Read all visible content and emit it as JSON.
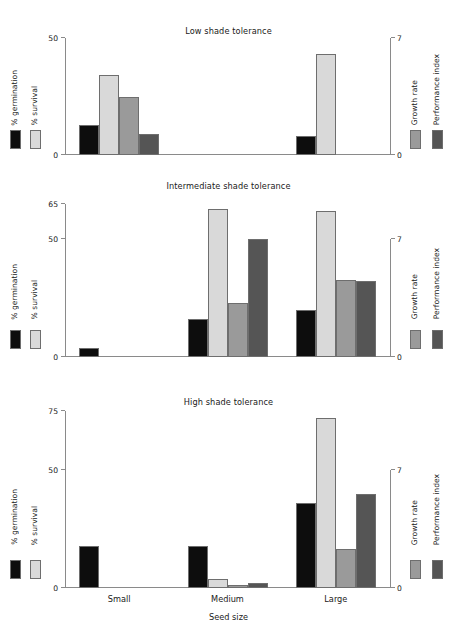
{
  "chart_data": {
    "type": "bar",
    "xlabel": "Seed size",
    "categories": [
      "Small",
      "Medium",
      "Large"
    ],
    "left_axis_label_1": "% germination",
    "left_axis_label_2": "% survival",
    "right_axis_label_1": "Growth rate",
    "right_axis_label_2": "Performance index",
    "grid": false,
    "legend_position": "outside-left-and-right",
    "colors": {
      "germination": "#0d0d0d",
      "survival": "#d9d9d9",
      "growth_rate": "#9a9a9a",
      "performance_index": "#555555",
      "axis": "#8a8a8a",
      "text": "#1a1a1a"
    },
    "panels": [
      {
        "id": "low",
        "title": "Low shade tolerance",
        "left_ticks": [
          0,
          50
        ],
        "left_tick_labels": [
          "0",
          "50"
        ],
        "left_lim": [
          0,
          50
        ],
        "right_ticks": [
          0,
          7
        ],
        "right_tick_labels": [
          "0",
          "7"
        ],
        "right_lim": [
          0,
          7
        ],
        "series": [
          {
            "name": "% germination",
            "axis": "left",
            "values": [
              13,
              0,
              8
            ]
          },
          {
            "name": "% survival",
            "axis": "left",
            "values": [
              34,
              0,
              43
            ]
          },
          {
            "name": "Growth rate",
            "axis": "right",
            "values": [
              3.5,
              0,
              0
            ]
          },
          {
            "name": "Performance index",
            "axis": "right",
            "values": [
              1.25,
              0,
              0
            ]
          }
        ]
      },
      {
        "id": "intermediate",
        "title": "Intermediate shade tolerance",
        "left_ticks": [
          0,
          50,
          65
        ],
        "left_tick_labels": [
          "0",
          "50",
          "65"
        ],
        "left_lim": [
          0,
          65
        ],
        "right_ticks": [
          0,
          7
        ],
        "right_tick_labels": [
          "0",
          "7"
        ],
        "right_lim": [
          0,
          7
        ],
        "series": [
          {
            "name": "% germination",
            "axis": "left",
            "values": [
              4,
              16,
              20
            ]
          },
          {
            "name": "% survival",
            "axis": "left",
            "values": [
              0,
              63,
              62
            ]
          },
          {
            "name": "Growth rate",
            "axis": "right",
            "values": [
              0,
              3.2,
              4.6
            ]
          },
          {
            "name": "Performance index",
            "axis": "right",
            "values": [
              0,
              7.0,
              4.5
            ]
          }
        ]
      },
      {
        "id": "high",
        "title": "High shade tolerance",
        "left_ticks": [
          0,
          50,
          75
        ],
        "left_tick_labels": [
          "0",
          "50",
          "75"
        ],
        "left_lim": [
          0,
          75
        ],
        "right_ticks": [
          0,
          7
        ],
        "right_tick_labels": [
          "0",
          "7"
        ],
        "right_lim": [
          0,
          7
        ],
        "series": [
          {
            "name": "% germination",
            "axis": "left",
            "values": [
              18,
              18,
              36
            ]
          },
          {
            "name": "% survival",
            "axis": "left",
            "values": [
              0,
              4,
              72
            ]
          },
          {
            "name": "Growth rate",
            "axis": "right",
            "values": [
              0,
              0.15,
              2.3
            ]
          },
          {
            "name": "Performance index",
            "axis": "right",
            "values": [
              0,
              0.3,
              5.6
            ]
          }
        ]
      }
    ]
  }
}
